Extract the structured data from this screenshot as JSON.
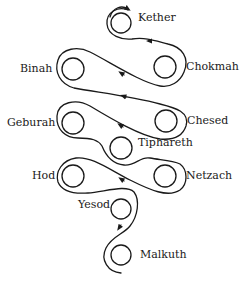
{
  "diagram": {
    "stroke_color": "#1a1a1a",
    "background": "#ffffff",
    "sephiroth": [
      {
        "name": "Kether",
        "cx": 121,
        "cy": 23,
        "r": 10,
        "label_x": 138,
        "label_y": 12
      },
      {
        "name": "Chokmah",
        "cx": 165,
        "cy": 67,
        "r": 11,
        "label_x": 186,
        "label_y": 61
      },
      {
        "name": "Binah",
        "cx": 73,
        "cy": 69,
        "r": 11,
        "label_x": 20,
        "label_y": 63
      },
      {
        "name": "Chesed",
        "cx": 166,
        "cy": 121,
        "r": 11,
        "label_x": 187,
        "label_y": 115
      },
      {
        "name": "Geburah",
        "cx": 73,
        "cy": 123,
        "r": 11,
        "label_x": 7,
        "label_y": 117
      },
      {
        "name": "Tiphareth",
        "cx": 121,
        "cy": 148,
        "r": 11,
        "label_x": 138,
        "label_y": 137
      },
      {
        "name": "Netzach",
        "cx": 165,
        "cy": 176,
        "r": 11,
        "label_x": 186,
        "label_y": 170
      },
      {
        "name": "Hod",
        "cx": 73,
        "cy": 176,
        "r": 11,
        "label_x": 32,
        "label_y": 170
      },
      {
        "name": "Yesod",
        "cx": 121,
        "cy": 209,
        "r": 10,
        "label_x": 78,
        "label_y": 199
      },
      {
        "name": "Malkuth",
        "cx": 121,
        "cy": 255,
        "r": 10,
        "label_x": 140,
        "label_y": 249
      }
    ]
  }
}
